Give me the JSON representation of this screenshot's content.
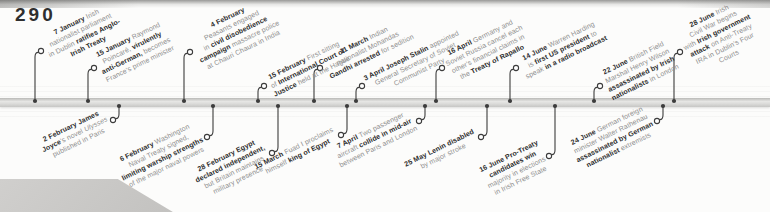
{
  "page": {
    "number": "290"
  },
  "colors": {
    "band": "#d9d9d7",
    "connector": "#3c3c3c",
    "strong": "#2d2d2d",
    "muted": "#8f8f8f",
    "tab": "#c9c9c7"
  },
  "timeline": {
    "events": [
      {
        "id": "7-january-anglo-irish-treaty",
        "side": "above",
        "x": 35,
        "end_y": 51,
        "lines": [
          [
            {
              "t": "7 January ",
              "s": "b"
            },
            {
              "t": "Irish",
              "s": "n"
            }
          ],
          [
            {
              "t": "nationalist parliament",
              "s": "n"
            }
          ],
          [
            {
              "t": "in Dublin ",
              "s": "n"
            },
            {
              "t": "ratifies Anglo-",
              "s": "b"
            }
          ],
          [
            {
              "t": "Irish Treaty",
              "s": "b"
            }
          ]
        ]
      },
      {
        "id": "15-january-poincare",
        "side": "above",
        "x": 88,
        "end_y": 68,
        "lines": [
          [
            {
              "t": "15 January ",
              "s": "b"
            },
            {
              "t": "Raymond",
              "s": "n"
            }
          ],
          [
            {
              "t": "Poincaré, ",
              "s": "n"
            },
            {
              "t": "virulently",
              "s": "b"
            }
          ],
          [
            {
              "t": "anti-German, ",
              "s": "b"
            },
            {
              "t": "becomes",
              "s": "n"
            }
          ],
          [
            {
              "t": "France's prime minister",
              "s": "n"
            }
          ]
        ]
      },
      {
        "id": "2-february-ulysses",
        "side": "below",
        "x": 119,
        "end_y": 120,
        "lines": [
          [
            {
              "t": "2 February James",
              "s": "b"
            }
          ],
          [
            {
              "t": "Joyce",
              "s": "b"
            },
            {
              "t": "'s novel ",
              "s": "n"
            },
            {
              "t": "Ulysses",
              "s": "i"
            }
          ],
          [
            {
              "t": "published in Paris",
              "s": "n"
            }
          ]
        ]
      },
      {
        "id": "4-february-chauri-chaura",
        "side": "above",
        "x": 184,
        "end_y": 52,
        "lines": [
          [
            {
              "t": "4 February",
              "s": "b"
            }
          ],
          [
            {
              "t": "Peasants engaged",
              "s": "n"
            }
          ],
          [
            {
              "t": "in ",
              "s": "n"
            },
            {
              "t": "civil disobedience",
              "s": "b"
            }
          ],
          [
            {
              "t": "campaign ",
              "s": "b"
            },
            {
              "t": "massacre police",
              "s": "n"
            }
          ],
          [
            {
              "t": "at Chauri Chaura in India",
              "s": "n"
            }
          ]
        ]
      },
      {
        "id": "6-february-washington-naval-treaty",
        "side": "below",
        "x": 213,
        "end_y": 137,
        "lines": [
          [
            {
              "t": "6 February ",
              "s": "b"
            },
            {
              "t": "Washington",
              "s": "n"
            }
          ],
          [
            {
              "t": "Naval Treaty signed,",
              "s": "n"
            }
          ],
          [
            {
              "t": "limiting warship strengths",
              "s": "b"
            }
          ],
          [
            {
              "t": "of the major naval powers",
              "s": "n"
            }
          ]
        ]
      },
      {
        "id": "15-february-international-court",
        "side": "above",
        "x": 258,
        "end_y": 86,
        "lines": [
          [
            {
              "t": "15 February ",
              "s": "b"
            },
            {
              "t": "First sitting",
              "s": "n"
            }
          ],
          [
            {
              "t": "of ",
              "s": "n"
            },
            {
              "t": "International Court of",
              "s": "b"
            }
          ],
          [
            {
              "t": "Justice ",
              "s": "b"
            },
            {
              "t": "held at the Hague",
              "s": "n"
            }
          ]
        ]
      },
      {
        "id": "28-february-egypt-independent",
        "side": "below",
        "x": 278,
        "end_y": 153,
        "lines": [
          [
            {
              "t": "28 February Egypt",
              "s": "b"
            }
          ],
          [
            {
              "t": "declared independent,",
              "s": "b"
            }
          ],
          [
            {
              "t": "but Britain maintains",
              "s": "n"
            }
          ],
          [
            {
              "t": "military presence",
              "s": "n"
            }
          ]
        ]
      },
      {
        "id": "11-march-gandhi-arrested",
        "side": "above",
        "x": 314,
        "end_y": 68,
        "lines": [
          [
            {
              "t": "11 March ",
              "s": "b"
            },
            {
              "t": "Indian",
              "s": "n"
            }
          ],
          [
            {
              "t": "nationalist Mohandas",
              "s": "n"
            }
          ],
          [
            {
              "t": "Gandhi arrested ",
              "s": "b"
            },
            {
              "t": "for sedition",
              "s": "n"
            }
          ]
        ]
      },
      {
        "id": "15-march-fuad-king",
        "side": "below",
        "x": 347,
        "end_y": 135,
        "lines": [
          [
            {
              "t": "15 March ",
              "s": "b"
            },
            {
              "t": "Fuad I proclaims",
              "s": "n"
            }
          ],
          [
            {
              "t": "himself ",
              "s": "n"
            },
            {
              "t": "king of Egypt",
              "s": "b"
            }
          ]
        ]
      },
      {
        "id": "3-april-stalin",
        "side": "above",
        "x": 356,
        "end_y": 86,
        "lines": [
          [
            {
              "t": "3 April Joseph Stalin ",
              "s": "b"
            },
            {
              "t": "appointed",
              "s": "n"
            }
          ],
          [
            {
              "t": "General Secretary of Soviet",
              "s": "n"
            }
          ],
          [
            {
              "t": "Communist Party",
              "s": "n"
            }
          ]
        ]
      },
      {
        "id": "7-april-midair-collision",
        "side": "below",
        "x": 425,
        "end_y": 121,
        "lines": [
          [
            {
              "t": "7 April ",
              "s": "b"
            },
            {
              "t": "Two passenger",
              "s": "n"
            }
          ],
          [
            {
              "t": "aircraft ",
              "s": "n"
            },
            {
              "t": "collide in mid-air",
              "s": "b"
            }
          ],
          [
            {
              "t": "between Paris and London",
              "s": "n"
            }
          ]
        ]
      },
      {
        "id": "16-april-treaty-of-rapallo",
        "side": "above",
        "x": 436,
        "end_y": 68,
        "lines": [
          [
            {
              "t": "16 April ",
              "s": "b"
            },
            {
              "t": "Germany and",
              "s": "n"
            }
          ],
          [
            {
              "t": "Soviet Russia cancel each",
              "s": "n"
            }
          ],
          [
            {
              "t": "other's financial claims in",
              "s": "n"
            }
          ],
          [
            {
              "t": "the ",
              "s": "n"
            },
            {
              "t": "Treaty of Rapallo",
              "s": "b"
            }
          ]
        ]
      },
      {
        "id": "25-may-lenin-stroke",
        "side": "below",
        "x": 487,
        "end_y": 137,
        "lines": [
          [
            {
              "t": "25 May Lenin disabled",
              "s": "b"
            }
          ],
          [
            {
              "t": "by major stroke",
              "s": "n"
            }
          ]
        ]
      },
      {
        "id": "14-june-harding-radio",
        "side": "above",
        "x": 510,
        "end_y": 68,
        "lines": [
          [
            {
              "t": "14 June ",
              "s": "b"
            },
            {
              "t": "Warren Harding",
              "s": "n"
            }
          ],
          [
            {
              "t": "is ",
              "s": "n"
            },
            {
              "t": "first US president ",
              "s": "b"
            },
            {
              "t": "to",
              "s": "n"
            }
          ],
          [
            {
              "t": "speak ",
              "s": "n"
            },
            {
              "t": "in a radio broadcast",
              "s": "b"
            }
          ]
        ]
      },
      {
        "id": "16-june-pro-treaty-win",
        "side": "below",
        "x": 555,
        "end_y": 156,
        "lines": [
          [
            {
              "t": "16 June Pro-Treaty",
              "s": "b"
            }
          ],
          [
            {
              "t": "candidates win",
              "s": "b"
            }
          ],
          [
            {
              "t": "majority in elections",
              "s": "n"
            }
          ],
          [
            {
              "t": "in Irish Free State",
              "s": "n"
            }
          ]
        ]
      },
      {
        "id": "22-june-wilson-assassinated",
        "side": "above",
        "x": 594,
        "end_y": 86,
        "lines": [
          [
            {
              "t": "22 June ",
              "s": "b"
            },
            {
              "t": "British Field",
              "s": "n"
            }
          ],
          [
            {
              "t": "Marshal Henry Wilson",
              "s": "n"
            }
          ],
          [
            {
              "t": "assassinated by Irish",
              "s": "b"
            }
          ],
          [
            {
              "t": "nationalists ",
              "s": "b"
            },
            {
              "t": "in London",
              "s": "n"
            }
          ]
        ]
      },
      {
        "id": "24-june-rathenau-assassinated",
        "side": "below",
        "x": 663,
        "end_y": 121,
        "lines": [
          [
            {
              "t": "24 June ",
              "s": "b"
            },
            {
              "t": "German foreign",
              "s": "n"
            }
          ],
          [
            {
              "t": "minister Walter Rathenau",
              "s": "n"
            }
          ],
          [
            {
              "t": "assassinated by German",
              "s": "b"
            }
          ],
          [
            {
              "t": "nationalist ",
              "s": "b"
            },
            {
              "t": "extremists",
              "s": "n"
            }
          ]
        ]
      },
      {
        "id": "28-june-irish-civil-war",
        "side": "above",
        "x": 674,
        "end_y": 52,
        "lines": [
          [
            {
              "t": "28 June ",
              "s": "b"
            },
            {
              "t": "Irish",
              "s": "n"
            }
          ],
          [
            {
              "t": "Civil War begins",
              "s": "n"
            }
          ],
          [
            {
              "t": "with ",
              "s": "n"
            },
            {
              "t": "Irish government",
              "s": "b"
            }
          ],
          [
            {
              "t": "attack ",
              "s": "b"
            },
            {
              "t": "on Anti-Treaty",
              "s": "n"
            }
          ],
          [
            {
              "t": "IRA in Dublin's Four",
              "s": "n"
            }
          ],
          [
            {
              "t": "Courts",
              "s": "n"
            }
          ]
        ]
      }
    ]
  }
}
